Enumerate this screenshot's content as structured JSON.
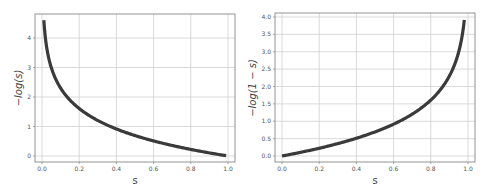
{
  "chart_data": [
    {
      "type": "line",
      "title": "",
      "xlabel": "s",
      "ylabel": "-log(s)",
      "xlim": [
        -0.02,
        1.04
      ],
      "ylim": [
        -0.2,
        4.8
      ],
      "xticks": [
        "0.0",
        "0.2",
        "0.4",
        "0.6",
        "0.8",
        "1.0"
      ],
      "yticks": [
        "0",
        "1",
        "2",
        "3",
        "4"
      ],
      "grid": true,
      "legend": null,
      "series": [
        {
          "name": "-log(s)",
          "color": "#3a3a3a",
          "x": [
            0.01,
            0.02,
            0.03,
            0.05,
            0.07,
            0.1,
            0.15,
            0.2,
            0.3,
            0.4,
            0.5,
            0.6,
            0.7,
            0.8,
            0.9,
            0.99
          ],
          "y": [
            4.61,
            3.91,
            3.51,
            3.0,
            2.66,
            2.3,
            1.9,
            1.61,
            1.2,
            0.92,
            0.69,
            0.51,
            0.36,
            0.22,
            0.11,
            0.01
          ]
        }
      ]
    },
    {
      "type": "line",
      "title": "",
      "xlabel": "s",
      "ylabel": "-log(1 - s)",
      "xlim": [
        -0.02,
        1.04
      ],
      "ylim": [
        -0.1,
        4.1
      ],
      "xticks": [
        "0.0",
        "0.2",
        "0.4",
        "0.6",
        "0.8",
        "1.0"
      ],
      "yticks": [
        "0.0",
        "0.5",
        "1.0",
        "1.5",
        "2.0",
        "2.5",
        "3.0",
        "3.5",
        "4.0"
      ],
      "grid": true,
      "legend": null,
      "series": [
        {
          "name": "-log(1 - s)",
          "color": "#3a3a3a",
          "x": [
            0.0,
            0.1,
            0.2,
            0.3,
            0.4,
            0.5,
            0.6,
            0.7,
            0.8,
            0.85,
            0.9,
            0.93,
            0.95,
            0.97,
            0.98
          ],
          "y": [
            0.0,
            0.11,
            0.22,
            0.36,
            0.51,
            0.69,
            0.92,
            1.2,
            1.61,
            1.9,
            2.3,
            2.66,
            3.0,
            3.51,
            3.91
          ]
        }
      ]
    }
  ],
  "left_chart": {
    "xlabel": "s",
    "ylabel": "−log(s)",
    "xticks": [
      "0.0",
      "0.2",
      "0.4",
      "0.6",
      "0.8",
      "1.0"
    ],
    "yticks": [
      "0",
      "1",
      "2",
      "3",
      "4"
    ]
  },
  "right_chart": {
    "xlabel": "s",
    "ylabel": "−log(1 − s)",
    "xticks": [
      "0.0",
      "0.2",
      "0.4",
      "0.6",
      "0.8",
      "1.0"
    ],
    "yticks": [
      "0.0",
      "0.5",
      "1.0",
      "1.5",
      "2.0",
      "2.5",
      "3.0",
      "3.5",
      "4.0"
    ]
  }
}
